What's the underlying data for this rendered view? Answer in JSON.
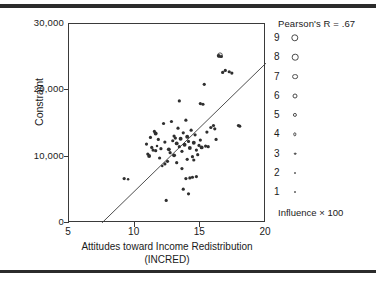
{
  "chart_data": {
    "type": "scatter",
    "title": "",
    "xlabel": "Attitudes toward Income Redistribution",
    "xlabel_line2": "(INCRED)",
    "ylabel": "Constraint",
    "xlim": [
      5,
      20
    ],
    "ylim": [
      0,
      30000
    ],
    "xticks": [
      "5",
      "10",
      "15",
      "20"
    ],
    "xtick_values": [
      5,
      10,
      15,
      20
    ],
    "yticks": [
      "0",
      "10,000",
      "20,000",
      "30,000"
    ],
    "ytick_values": [
      0,
      10000,
      20000,
      30000
    ],
    "grid": false,
    "annotation": "Pearson's R = .67",
    "pearson_r": 0.67,
    "size_encoding": "Influence × 100",
    "regression_line": {
      "x_start": 7.5,
      "y_start": 0,
      "x_end": 20.0,
      "y_end": 24100
    },
    "points": [
      {
        "x": 9.2,
        "y": 6700,
        "s": 3
      },
      {
        "x": 9.5,
        "y": 6600,
        "s": 2
      },
      {
        "x": 10.9,
        "y": 11900,
        "s": 3
      },
      {
        "x": 11.0,
        "y": 10400,
        "s": 3
      },
      {
        "x": 11.1,
        "y": 10100,
        "s": 4
      },
      {
        "x": 11.2,
        "y": 12900,
        "s": 3
      },
      {
        "x": 11.3,
        "y": 11400,
        "s": 3
      },
      {
        "x": 11.4,
        "y": 11000,
        "s": 3
      },
      {
        "x": 11.5,
        "y": 13800,
        "s": 3
      },
      {
        "x": 11.6,
        "y": 13500,
        "s": 4
      },
      {
        "x": 11.6,
        "y": 10900,
        "s": 3
      },
      {
        "x": 11.7,
        "y": 11600,
        "s": 2
      },
      {
        "x": 11.8,
        "y": 12600,
        "s": 3
      },
      {
        "x": 11.9,
        "y": 9800,
        "s": 3
      },
      {
        "x": 12.0,
        "y": 11200,
        "s": 3
      },
      {
        "x": 12.1,
        "y": 8600,
        "s": 2
      },
      {
        "x": 12.2,
        "y": 15000,
        "s": 3
      },
      {
        "x": 12.3,
        "y": 12200,
        "s": 3
      },
      {
        "x": 12.3,
        "y": 8900,
        "s": 3
      },
      {
        "x": 12.4,
        "y": 3400,
        "s": 3
      },
      {
        "x": 12.5,
        "y": 9300,
        "s": 3
      },
      {
        "x": 12.6,
        "y": 11100,
        "s": 4
      },
      {
        "x": 12.7,
        "y": 10600,
        "s": 3
      },
      {
        "x": 12.8,
        "y": 15300,
        "s": 3
      },
      {
        "x": 12.9,
        "y": 12400,
        "s": 3
      },
      {
        "x": 13.0,
        "y": 10200,
        "s": 4
      },
      {
        "x": 13.0,
        "y": 13100,
        "s": 3
      },
      {
        "x": 13.1,
        "y": 12800,
        "s": 3
      },
      {
        "x": 13.2,
        "y": 12000,
        "s": 4
      },
      {
        "x": 13.2,
        "y": 9100,
        "s": 3
      },
      {
        "x": 13.3,
        "y": 14300,
        "s": 3
      },
      {
        "x": 13.4,
        "y": 11500,
        "s": 3
      },
      {
        "x": 13.4,
        "y": 18400,
        "s": 3
      },
      {
        "x": 13.5,
        "y": 12700,
        "s": 4
      },
      {
        "x": 13.6,
        "y": 8200,
        "s": 3
      },
      {
        "x": 13.6,
        "y": 10800,
        "s": 3
      },
      {
        "x": 13.7,
        "y": 13600,
        "s": 3
      },
      {
        "x": 13.7,
        "y": 5100,
        "s": 3
      },
      {
        "x": 13.8,
        "y": 11800,
        "s": 4
      },
      {
        "x": 13.9,
        "y": 15500,
        "s": 3
      },
      {
        "x": 13.9,
        "y": 6700,
        "s": 3
      },
      {
        "x": 14.0,
        "y": 13000,
        "s": 4
      },
      {
        "x": 14.0,
        "y": 9600,
        "s": 3
      },
      {
        "x": 14.1,
        "y": 12300,
        "s": 3
      },
      {
        "x": 14.1,
        "y": 4400,
        "s": 3
      },
      {
        "x": 14.2,
        "y": 11300,
        "s": 4
      },
      {
        "x": 14.2,
        "y": 6800,
        "s": 3
      },
      {
        "x": 14.3,
        "y": 14000,
        "s": 3
      },
      {
        "x": 14.4,
        "y": 10000,
        "s": 3
      },
      {
        "x": 14.4,
        "y": 6900,
        "s": 3
      },
      {
        "x": 14.5,
        "y": 12100,
        "s": 4
      },
      {
        "x": 14.5,
        "y": 9500,
        "s": 3
      },
      {
        "x": 14.6,
        "y": 13300,
        "s": 3
      },
      {
        "x": 14.7,
        "y": 11000,
        "s": 3
      },
      {
        "x": 14.7,
        "y": 7000,
        "s": 3
      },
      {
        "x": 14.8,
        "y": 10300,
        "s": 3
      },
      {
        "x": 14.9,
        "y": 11700,
        "s": 3
      },
      {
        "x": 15.0,
        "y": 12500,
        "s": 3
      },
      {
        "x": 15.0,
        "y": 18000,
        "s": 3
      },
      {
        "x": 15.1,
        "y": 11400,
        "s": 4
      },
      {
        "x": 15.2,
        "y": 17900,
        "s": 3
      },
      {
        "x": 15.3,
        "y": 20900,
        "s": 3
      },
      {
        "x": 15.4,
        "y": 11600,
        "s": 3
      },
      {
        "x": 15.5,
        "y": 13700,
        "s": 3
      },
      {
        "x": 15.6,
        "y": 11500,
        "s": 3
      },
      {
        "x": 15.8,
        "y": 14400,
        "s": 3
      },
      {
        "x": 16.0,
        "y": 14700,
        "s": 3
      },
      {
        "x": 16.1,
        "y": 14200,
        "s": 3
      },
      {
        "x": 16.2,
        "y": 12600,
        "s": 3
      },
      {
        "x": 16.4,
        "y": 25200,
        "s": 4
      },
      {
        "x": 16.5,
        "y": 25300,
        "s": 5
      },
      {
        "x": 16.6,
        "y": 25100,
        "s": 3
      },
      {
        "x": 16.7,
        "y": 22700,
        "s": 3
      },
      {
        "x": 16.9,
        "y": 23000,
        "s": 3
      },
      {
        "x": 17.2,
        "y": 22800,
        "s": 3
      },
      {
        "x": 17.4,
        "y": 22600,
        "s": 3
      },
      {
        "x": 17.9,
        "y": 14700,
        "s": 3
      },
      {
        "x": 18.0,
        "y": 14600,
        "s": 3
      }
    ]
  },
  "axes": {
    "y_label": "Constraint",
    "y_ticks": [
      {
        "label": "30,000",
        "value": 30000
      },
      {
        "label": "20,000",
        "value": 20000
      },
      {
        "label": "10,000",
        "value": 10000
      },
      {
        "label": "0",
        "value": 0
      }
    ],
    "x_label_line1": "Attitudes toward Income Redistribution",
    "x_label_line2": "(INCRED)",
    "x_ticks": [
      {
        "label": "5",
        "value": 5
      },
      {
        "label": "10",
        "value": 10
      },
      {
        "label": "15",
        "value": 15
      },
      {
        "label": "20",
        "value": 20
      }
    ]
  },
  "legend": {
    "title": "Pearson's R = .67",
    "footer": "Influence × 100",
    "items": [
      {
        "label": "9",
        "size": 7.4,
        "filled": false
      },
      {
        "label": "8",
        "size": 6.6,
        "filled": false
      },
      {
        "label": "7",
        "size": 5.8,
        "filled": false
      },
      {
        "label": "6",
        "size": 5.0,
        "filled": false
      },
      {
        "label": "5",
        "size": 4.2,
        "filled": false
      },
      {
        "label": "4",
        "size": 3.4,
        "filled": false
      },
      {
        "label": "3",
        "size": 2.6,
        "filled": true
      },
      {
        "label": "2",
        "size": 2.0,
        "filled": true
      },
      {
        "label": "1",
        "size": 1.5,
        "filled": true
      }
    ]
  },
  "colors": {
    "ink": "#1a1a1a",
    "axis": "#3a3a3a",
    "point": "#2f2f2f",
    "rule": "#2b2b2b",
    "background": "#ffffff"
  }
}
